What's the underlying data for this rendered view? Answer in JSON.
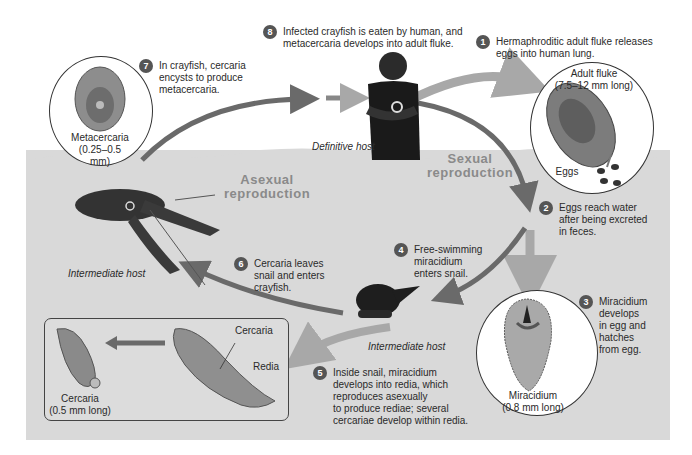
{
  "colors": {
    "water": "#d9d9d9",
    "arrow_dark": "#6a6a6a",
    "arrow_light": "#a8a8a8",
    "step_badge": "#555555",
    "repro_label": "#8a8a8a"
  },
  "steps": [
    {
      "num": "1",
      "text": "Hermaphroditic adult fluke releases\neggs into human lung."
    },
    {
      "num": "2",
      "text": "Eggs reach water\nafter being excreted\nin feces."
    },
    {
      "num": "3",
      "text": "Miracidium\ndevelops\nin egg and\nhatches\nfrom egg."
    },
    {
      "num": "4",
      "text": "Free-swimming\nmiracidium\nenters snail."
    },
    {
      "num": "5",
      "text": "Inside snail, miracidium\ndevelops into redia, which\nreproduces asexually\nto produce rediae; several\ncercariae develop within redia."
    },
    {
      "num": "6",
      "text": "Cercaria leaves\nsnail and enters\ncrayfish."
    },
    {
      "num": "7",
      "text": "In crayfish, cercaria\nencysts to produce\nmetacercaria."
    },
    {
      "num": "8",
      "text": "Infected crayfish is eaten by human, and\nmetacercaria develops into adult fluke."
    }
  ],
  "stages": {
    "adult_fluke": "Adult fluke\n(7.5–12 mm long)",
    "eggs": "Eggs",
    "miracidium": "Miracidium\n(0.8 mm long)",
    "metacercaria": "Metacercaria\n(0.25–0.5 mm)",
    "cercaria": "Cercaria\n(0.5 mm long)",
    "redia_cercaria": "Cercaria",
    "redia": "Redia"
  },
  "hosts": {
    "definitive": "Definitive host",
    "intermediate_crayfish": "Intermediate host",
    "intermediate_snail": "Intermediate host"
  },
  "reproduction": {
    "sexual": "Sexual\nreproduction",
    "asexual": "Asexual\nreproduction"
  }
}
